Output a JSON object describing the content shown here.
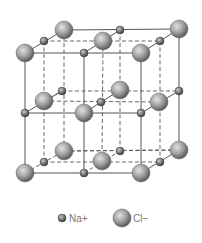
{
  "colors": {
    "background": "#ffffff",
    "line": "#555555",
    "sphere_light": "#d8d8d8",
    "sphere_mid": "#9a9a9a",
    "sphere_dark": "#5e5e5e",
    "label": "#777777"
  },
  "legend": {
    "items": [
      {
        "ion": "Na",
        "label": "Na+",
        "size": "small",
        "x": 62,
        "y": 218,
        "label_x": 69
      },
      {
        "ion": "Cl",
        "label": "Cl−",
        "size": "large",
        "x": 122,
        "y": 218,
        "label_x": 133
      }
    ]
  },
  "radii": {
    "small": 4,
    "large": 9
  },
  "lattice": {
    "solid_lines": [
      [
        25,
        53,
        141,
        53
      ],
      [
        141,
        53,
        141,
        173
      ],
      [
        141,
        173,
        25,
        173
      ],
      [
        25,
        173,
        25,
        53
      ],
      [
        64,
        30,
        179,
        29
      ],
      [
        179,
        29,
        179,
        150
      ],
      [
        25,
        53,
        64,
        30
      ],
      [
        141,
        53,
        179,
        29
      ],
      [
        141,
        173,
        179,
        150
      ],
      [
        84,
        53,
        84,
        173
      ],
      [
        25,
        113,
        141,
        113
      ],
      [
        84,
        53,
        120,
        30
      ],
      [
        141,
        113,
        179,
        91
      ],
      [
        84,
        113,
        120,
        90
      ],
      [
        25,
        113,
        62,
        91
      ]
    ],
    "dashed_lines": [
      [
        64,
        30,
        64,
        151
      ],
      [
        64,
        151,
        179,
        150
      ],
      [
        25,
        173,
        64,
        151
      ],
      [
        44,
        41,
        44,
        162
      ],
      [
        103,
        41,
        102,
        161
      ],
      [
        160,
        41,
        160,
        162
      ],
      [
        44,
        41,
        160,
        41
      ],
      [
        44,
        101,
        159,
        102
      ],
      [
        44,
        162,
        160,
        162
      ],
      [
        62,
        91,
        179,
        91
      ],
      [
        120,
        30,
        120,
        151
      ],
      [
        84,
        173,
        120,
        151
      ],
      [
        64,
        151,
        179,
        150
      ],
      [
        44,
        101,
        62,
        91
      ]
    ],
    "atoms": [
      {
        "ion": "Cl",
        "x": 64,
        "y": 30
      },
      {
        "ion": "Na",
        "x": 120,
        "y": 30
      },
      {
        "ion": "Cl",
        "x": 179,
        "y": 29
      },
      {
        "ion": "Na",
        "x": 44,
        "y": 41
      },
      {
        "ion": "Cl",
        "x": 103,
        "y": 41
      },
      {
        "ion": "Na",
        "x": 160,
        "y": 41
      },
      {
        "ion": "Cl",
        "x": 25,
        "y": 53
      },
      {
        "ion": "Na",
        "x": 84,
        "y": 53
      },
      {
        "ion": "Cl",
        "x": 141,
        "y": 53
      },
      {
        "ion": "Na",
        "x": 62,
        "y": 91
      },
      {
        "ion": "Cl",
        "x": 120,
        "y": 90
      },
      {
        "ion": "Na",
        "x": 179,
        "y": 91
      },
      {
        "ion": "Cl",
        "x": 44,
        "y": 101
      },
      {
        "ion": "Na",
        "x": 101,
        "y": 102
      },
      {
        "ion": "Cl",
        "x": 159,
        "y": 102
      },
      {
        "ion": "Na",
        "x": 25,
        "y": 113
      },
      {
        "ion": "Cl",
        "x": 84,
        "y": 113
      },
      {
        "ion": "Na",
        "x": 141,
        "y": 113
      },
      {
        "ion": "Cl",
        "x": 64,
        "y": 151
      },
      {
        "ion": "Na",
        "x": 120,
        "y": 151
      },
      {
        "ion": "Cl",
        "x": 179,
        "y": 150
      },
      {
        "ion": "Na",
        "x": 44,
        "y": 162
      },
      {
        "ion": "Cl",
        "x": 102,
        "y": 161
      },
      {
        "ion": "Na",
        "x": 160,
        "y": 162
      },
      {
        "ion": "Cl",
        "x": 25,
        "y": 173
      },
      {
        "ion": "Na",
        "x": 84,
        "y": 173
      },
      {
        "ion": "Cl",
        "x": 141,
        "y": 173
      }
    ]
  }
}
